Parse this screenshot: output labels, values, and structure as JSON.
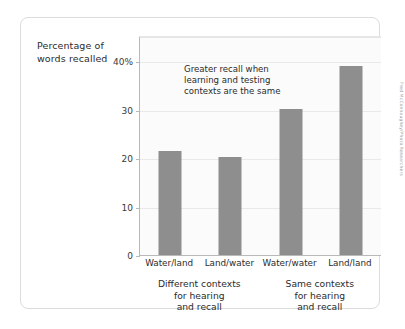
{
  "chart_data": {
    "type": "bar",
    "title": "",
    "xlabel": "",
    "ylabel": "Percentage of words recalled",
    "categories": [
      "Water/land",
      "Land/water",
      "Water/water",
      "Land/land"
    ],
    "values": [
      21.5,
      20.3,
      30.2,
      39.0
    ],
    "ylim": [
      0,
      45
    ],
    "yticks": [
      0,
      10,
      20,
      30,
      40
    ],
    "ytick_labels": [
      "0",
      "10",
      "20",
      "30",
      "40%"
    ],
    "grid": true,
    "legend": null,
    "bar_color": "#8e8e8e",
    "annotations": [
      {
        "text": "Greater recall when learning and testing contexts are the same",
        "lines": [
          "Greater recall when",
          "learning and testing",
          "contexts are the same"
        ]
      }
    ],
    "group_captions": [
      {
        "lines": [
          "Different contexts",
          "for hearing",
          "and recall"
        ],
        "categories": [
          "Water/land",
          "Land/water"
        ]
      },
      {
        "lines": [
          "Same contexts",
          "for hearing",
          "and recall"
        ],
        "categories": [
          "Water/water",
          "Land/land"
        ]
      }
    ]
  },
  "axis_label": {
    "line1": "Percentage of",
    "line2": "words recalled"
  },
  "credit": "Fred McConnaughey/Photo Researchers"
}
